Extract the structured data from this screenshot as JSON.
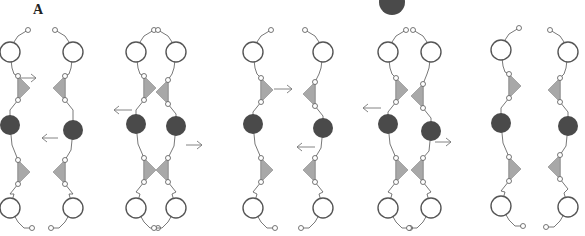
{
  "figure": {
    "panel_label": "A",
    "colors": {
      "line": "#555555",
      "open_circle_stroke": "#555555",
      "filled_circle": "#4a4a4a",
      "triangle_fill": "#a8a8a8",
      "arrow": "#777777"
    },
    "legend_marker": {
      "shape": "filled-circle",
      "cx": 392,
      "cy": 2,
      "r": 13
    },
    "pairs": [
      {
        "left": {
          "x": 10,
          "open_top_y": 52,
          "tri_y": 88,
          "tri_dir": "right",
          "filled_y": 125,
          "tri2_y": 172,
          "tri2_dir": "right",
          "open_bot_y": 208
        },
        "right": {
          "x": 73,
          "open_top_y": 52,
          "tri_y": 88,
          "tri_dir": "left",
          "filled_y": 130,
          "tri2_y": 172,
          "tri2_dir": "left",
          "open_bot_y": 208
        },
        "arrows": [
          {
            "x1": 20,
            "x2": 36,
            "y": 78,
            "dir": "right"
          },
          {
            "x1": 58,
            "x2": 42,
            "y": 138,
            "dir": "left"
          }
        ]
      },
      {
        "left": {
          "x": 136,
          "open_top_y": 52,
          "tri_y": 88,
          "tri_dir": "right",
          "filled_y": 124,
          "tri2_y": 170,
          "tri2_dir": "right",
          "open_bot_y": 208
        },
        "right": {
          "x": 176,
          "open_top_y": 52,
          "tri_y": 92,
          "tri_dir": "left",
          "filled_y": 126,
          "tri2_y": 170,
          "tri2_dir": "left",
          "open_bot_y": 208
        },
        "arrows": [
          {
            "x1": 132,
            "x2": 114,
            "y": 110,
            "dir": "left"
          },
          {
            "x1": 186,
            "x2": 202,
            "y": 145,
            "dir": "right"
          }
        ]
      },
      {
        "left": {
          "x": 253,
          "open_top_y": 52,
          "tri_y": 90,
          "tri_dir": "right",
          "filled_y": 124,
          "tri2_y": 170,
          "tri2_dir": "right",
          "open_bot_y": 208
        },
        "right": {
          "x": 323,
          "open_top_y": 52,
          "tri_y": 94,
          "tri_dir": "left",
          "filled_y": 128,
          "tri2_y": 170,
          "tri2_dir": "left",
          "open_bot_y": 208
        },
        "arrows": [
          {
            "x1": 274,
            "x2": 292,
            "y": 89,
            "dir": "right"
          },
          {
            "x1": 315,
            "x2": 297,
            "y": 147,
            "dir": "left"
          }
        ]
      },
      {
        "left": {
          "x": 388,
          "open_top_y": 52,
          "tri_y": 90,
          "tri_dir": "right",
          "filled_y": 124,
          "tri2_y": 170,
          "tri2_dir": "right",
          "open_bot_y": 208
        },
        "right": {
          "x": 431,
          "open_top_y": 52,
          "tri_y": 96,
          "tri_dir": "left",
          "filled_y": 131,
          "tri2_y": 170,
          "tri2_dir": "left",
          "open_bot_y": 208
        },
        "arrows": [
          {
            "x1": 381,
            "x2": 363,
            "y": 108,
            "dir": "left"
          },
          {
            "x1": 435,
            "x2": 451,
            "y": 142,
            "dir": "right"
          }
        ]
      },
      {
        "left": {
          "x": 501,
          "open_top_y": 50,
          "tri_y": 86,
          "tri_dir": "right",
          "filled_y": 123,
          "tri2_y": 169,
          "tri2_dir": "right",
          "open_bot_y": 206
        },
        "right": {
          "x": 568,
          "open_top_y": 52,
          "tri_y": 90,
          "tri_dir": "left",
          "filled_y": 126,
          "tri2_y": 167,
          "tri2_dir": "left",
          "open_bot_y": 207
        },
        "arrows": []
      }
    ]
  }
}
